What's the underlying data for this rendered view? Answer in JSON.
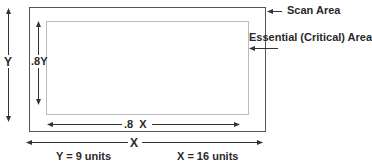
{
  "diagram": {
    "labels": {
      "scan_area": "Scan Area",
      "essential_area": "Essential (Critical) Area",
      "y_dimension": "Y",
      "inner_y_dimension": ".8Y",
      "inner_x_dimension": ".8  X",
      "x_dimension": "X",
      "y_value": "Y = 9 units",
      "x_value": "X = 16 units"
    },
    "colors": {
      "outer_border": "#555555",
      "inner_border": "#bbbbbb",
      "arrow": "#333333",
      "text": "#2a2a2a"
    }
  }
}
